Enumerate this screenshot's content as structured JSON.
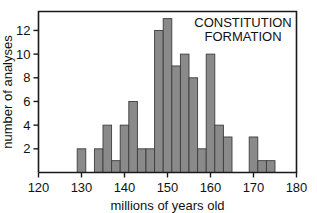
{
  "chart_data": {
    "type": "bar",
    "title": "CONSTITUTION FORMATION",
    "title_lines": [
      "CONSTITUTION",
      "FORMATION"
    ],
    "xlabel": "millions of years old",
    "ylabel": "number of analyses",
    "xlim": [
      120,
      180
    ],
    "ylim": [
      0,
      13.6
    ],
    "grid": false,
    "legend": null,
    "bin_width": 2,
    "xticks": [
      120,
      130,
      140,
      150,
      160,
      170,
      180
    ],
    "xtick_labels": [
      "120",
      "130",
      "140",
      "150",
      "160",
      "170",
      "180"
    ],
    "yticks": [
      2,
      4,
      6,
      8,
      10,
      12
    ],
    "ytick_labels": [
      "2",
      "4",
      "6",
      "8",
      "10",
      "12"
    ],
    "bar_color": "#8a8a8a",
    "bar_edge_color": "#3d3d3d",
    "axis_color": "#1a1a1a",
    "bins": [
      {
        "x0": 129,
        "x1": 131,
        "value": 2
      },
      {
        "x0": 133,
        "x1": 135,
        "value": 2
      },
      {
        "x0": 135,
        "x1": 137,
        "value": 4
      },
      {
        "x0": 137,
        "x1": 139,
        "value": 1
      },
      {
        "x0": 139,
        "x1": 141,
        "value": 4
      },
      {
        "x0": 141,
        "x1": 143,
        "value": 6
      },
      {
        "x0": 143,
        "x1": 145,
        "value": 2
      },
      {
        "x0": 145,
        "x1": 147,
        "value": 2
      },
      {
        "x0": 147,
        "x1": 149,
        "value": 12
      },
      {
        "x0": 149,
        "x1": 151,
        "value": 13
      },
      {
        "x0": 151,
        "x1": 153,
        "value": 9
      },
      {
        "x0": 153,
        "x1": 155,
        "value": 10
      },
      {
        "x0": 155,
        "x1": 157,
        "value": 8
      },
      {
        "x0": 157,
        "x1": 159,
        "value": 2
      },
      {
        "x0": 159,
        "x1": 161,
        "value": 10
      },
      {
        "x0": 161,
        "x1": 163,
        "value": 4
      },
      {
        "x0": 163,
        "x1": 165,
        "value": 3
      },
      {
        "x0": 169,
        "x1": 171,
        "value": 3
      },
      {
        "x0": 171,
        "x1": 173,
        "value": 1
      },
      {
        "x0": 173,
        "x1": 175,
        "value": 1
      }
    ],
    "categories": [
      "129-131",
      "133-135",
      "135-137",
      "137-139",
      "139-141",
      "141-143",
      "143-145",
      "145-147",
      "147-149",
      "149-151",
      "151-153",
      "153-155",
      "155-157",
      "157-159",
      "159-161",
      "161-163",
      "163-165",
      "169-171",
      "171-173",
      "173-175"
    ],
    "values": [
      2,
      2,
      4,
      1,
      4,
      6,
      2,
      2,
      12,
      13,
      9,
      10,
      8,
      2,
      10,
      4,
      3,
      3,
      1,
      1
    ]
  }
}
